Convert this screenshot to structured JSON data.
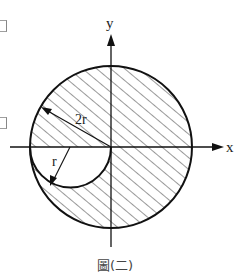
{
  "figure": {
    "caption": "圖(二)",
    "axes": {
      "x_label": "x",
      "y_label": "y"
    },
    "large_circle": {
      "label": "2r",
      "cx": 111,
      "cy": 147,
      "r": 81
    },
    "small_circle": {
      "label": "r",
      "cx": 70.5,
      "cy": 147,
      "r": 40.5,
      "drawn": "lower semicircle (cut-out)"
    },
    "colors": {
      "stroke": "#111111",
      "hatch": "#333333",
      "background": "#ffffff"
    }
  }
}
